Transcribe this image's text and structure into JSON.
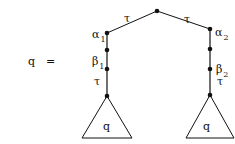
{
  "equation": {
    "lhs": "q",
    "equals": "="
  },
  "tree": {
    "root_edges": {
      "left_label": "τ",
      "right_label": "τ"
    },
    "left_branch": {
      "label_1": {
        "sym": "α",
        "sub": "1"
      },
      "label_2": {
        "sym": "β",
        "sub": "1"
      },
      "label_3": "τ",
      "subtree": "q"
    },
    "right_branch": {
      "label_1": {
        "sym": "α",
        "sub": "2"
      },
      "label_2": {
        "sym": "β",
        "sub": "2"
      },
      "label_3": "τ",
      "subtree": "q"
    }
  }
}
